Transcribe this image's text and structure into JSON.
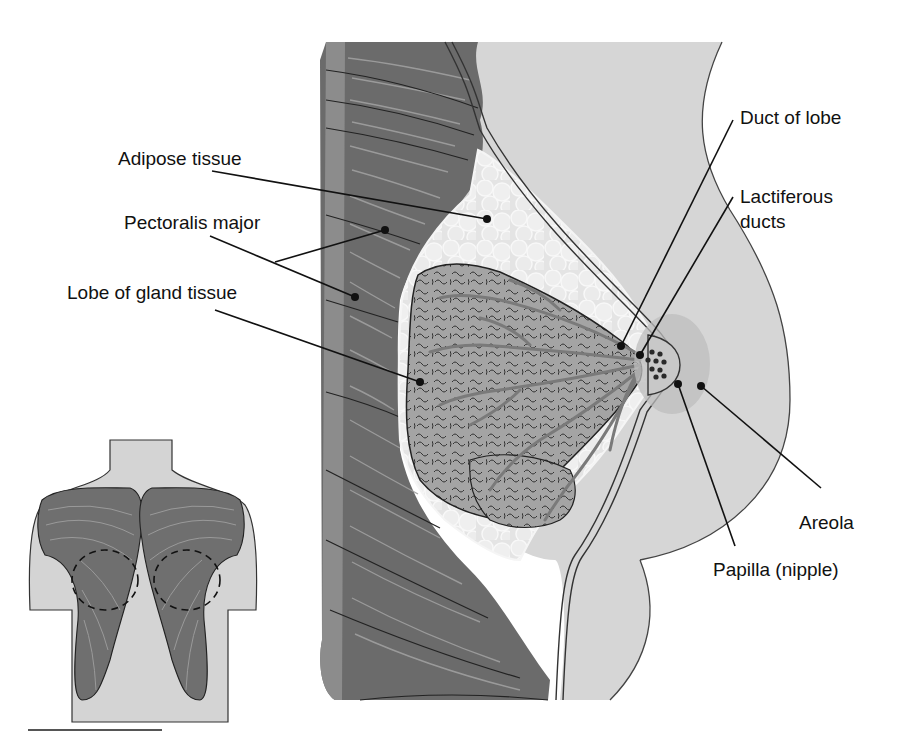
{
  "figure": {
    "type": "anatomical-diagram",
    "colors": {
      "background": "#ffffff",
      "muscle": "#6e6e6e",
      "muscle_light": "#8a8a8a",
      "skin": "#d9d9d9",
      "adipose": "#e6e6e6",
      "gland": "#9c9c9c",
      "areola": "#bdbdbd",
      "line": "#111111"
    },
    "labels": [
      {
        "id": "adipose-tissue",
        "text": "Adipose tissue"
      },
      {
        "id": "pectoralis-major",
        "text": "Pectoralis major"
      },
      {
        "id": "lobe-of-gland-tissue",
        "text": "Lobe of gland tissue"
      },
      {
        "id": "duct-of-lobe",
        "text": "Duct of lobe"
      },
      {
        "id": "lactiferous-ducts-line1",
        "text": "Lactiferous"
      },
      {
        "id": "lactiferous-ducts-line2",
        "text": "ducts"
      },
      {
        "id": "areola",
        "text": "Areola"
      },
      {
        "id": "papilla",
        "text": "Papilla (nipple)"
      }
    ],
    "inset": {
      "subject": "Anterior torso showing pectoralis major muscles with dashed circles marking breast positions"
    }
  }
}
